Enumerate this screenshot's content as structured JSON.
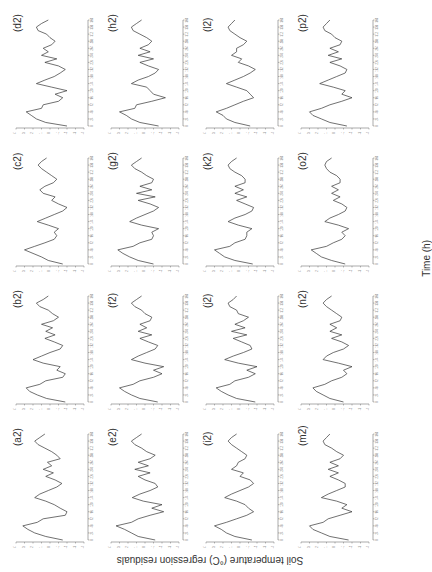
{
  "figure": {
    "y_axis_title": "Soil temperature (°C) regression residuals",
    "x_axis_title": "Time (h)",
    "orientation_note": "rotated 90° counter-clockwise",
    "line_color": "#333333",
    "axis_color": "#555555"
  },
  "chart_data": {
    "type": "line",
    "title": "",
    "xlabel": "Time (h)",
    "ylabel": "Soil temperature (°C) regression residuals",
    "x_ticks": [
      0,
      24,
      48,
      72,
      96,
      120,
      144,
      168,
      192,
      216,
      240,
      264,
      288,
      312,
      336,
      360
    ],
    "y_ticks": [
      -4,
      -3,
      -2,
      -1,
      0,
      1,
      2,
      3,
      4
    ],
    "xlim": [
      0,
      360
    ],
    "ylim": [
      -4,
      4
    ],
    "grid": false,
    "legend": "none",
    "x": [
      0,
      12,
      24,
      36,
      48,
      60,
      72,
      84,
      96,
      108,
      120,
      132,
      144,
      156,
      168,
      180,
      192,
      204,
      216,
      228,
      240,
      252,
      264,
      276,
      288,
      300,
      312,
      324,
      336,
      348,
      360
    ],
    "layout": {
      "rows": [
        [
          "d2",
          "h2",
          "l2",
          "p2"
        ],
        [
          "c2",
          "g2",
          "k2",
          "o2"
        ],
        [
          "b2",
          "f2",
          "j2",
          "n2"
        ],
        [
          "a2",
          "e2",
          "i2",
          "m2"
        ]
      ]
    },
    "panels": [
      {
        "id": "a2",
        "label": "(a2)",
        "values": [
          -1.5,
          0.5,
          1.8,
          2.6,
          3.2,
          1.5,
          0.8,
          -1.8,
          -2.0,
          -1.2,
          -0.5,
          0.5,
          1.8,
          1.2,
          0.2,
          -0.8,
          -1.4,
          -0.6,
          0.5,
          -0.4,
          0.8,
          -0.2,
          0.3,
          -1.2,
          -0.8,
          -0.2,
          0.6,
          1.4,
          1.8,
          1.2,
          0.6
        ]
      },
      {
        "id": "b2",
        "label": "(b2)",
        "values": [
          -1.8,
          0.4,
          1.5,
          2.4,
          2.8,
          1.2,
          0.5,
          -1.5,
          -1.8,
          -0.8,
          -1.2,
          0.8,
          2.0,
          1.0,
          0.0,
          -1.2,
          -1.5,
          -0.5,
          0.6,
          -0.6,
          0.5,
          -0.3,
          1.0,
          -0.4,
          -1.0,
          -0.3,
          0.2,
          1.2,
          1.6,
          0.8,
          0.2
        ]
      },
      {
        "id": "c2",
        "label": "(c2)",
        "values": [
          -1.5,
          0.2,
          1.0,
          2.0,
          3.0,
          1.8,
          0.6,
          -0.5,
          -0.8,
          -0.5,
          -1.0,
          0.2,
          1.5,
          0.5,
          -0.5,
          -1.5,
          -2.0,
          -1.0,
          -0.2,
          -0.6,
          0.8,
          1.2,
          0.6,
          -0.4,
          -0.8,
          -0.2,
          0.4,
          1.0,
          1.4,
          1.0,
          0.4
        ]
      },
      {
        "id": "d2",
        "label": "(d2)",
        "values": [
          -2.0,
          0.5,
          1.6,
          2.2,
          2.8,
          1.0,
          0.8,
          -1.0,
          -1.5,
          -0.6,
          -2.0,
          -0.2,
          1.6,
          0.6,
          -0.5,
          -1.2,
          -1.8,
          -1.0,
          0.6,
          -0.8,
          1.0,
          0.2,
          0.8,
          -0.2,
          -0.6,
          0.0,
          0.4,
          1.4,
          1.6,
          1.0,
          0.2
        ]
      },
      {
        "id": "e2",
        "label": "(e2)",
        "values": [
          -1.2,
          0.8,
          1.6,
          2.4,
          3.4,
          1.6,
          0.8,
          -0.6,
          -2.2,
          -0.8,
          -2.0,
          0.2,
          1.5,
          0.6,
          -0.6,
          -1.5,
          -1.2,
          0.0,
          0.8,
          -0.6,
          1.2,
          -0.4,
          0.8,
          -0.6,
          -1.2,
          -0.2,
          0.4,
          1.2,
          1.6,
          1.0,
          0.4
        ]
      },
      {
        "id": "f2",
        "label": "(f2)",
        "values": [
          -1.5,
          0.6,
          1.6,
          2.4,
          3.0,
          1.4,
          0.6,
          -1.0,
          -2.0,
          -1.0,
          -2.2,
          0.0,
          1.6,
          0.8,
          -0.2,
          -1.2,
          -1.5,
          -0.4,
          0.6,
          -0.8,
          0.8,
          -0.2,
          0.6,
          -0.6,
          -0.8,
          0.0,
          0.4,
          1.2,
          1.6,
          1.0,
          0.4
        ]
      },
      {
        "id": "g2",
        "label": "(g2)",
        "values": [
          -1.0,
          0.8,
          1.8,
          2.6,
          3.2,
          1.4,
          0.6,
          -0.8,
          -1.0,
          -0.8,
          -1.6,
          0.4,
          1.8,
          1.0,
          0.0,
          -1.0,
          -1.6,
          -0.6,
          0.8,
          -1.2,
          1.0,
          -0.8,
          0.6,
          -0.8,
          -1.0,
          -0.2,
          0.4,
          1.2,
          1.6,
          1.0,
          0.4
        ]
      },
      {
        "id": "h2",
        "label": "(h2)",
        "values": [
          -1.6,
          0.6,
          1.6,
          2.2,
          3.0,
          1.2,
          1.0,
          -0.8,
          -2.4,
          -1.0,
          -0.6,
          -0.2,
          1.6,
          0.8,
          -0.4,
          -1.2,
          -1.6,
          -0.4,
          0.6,
          -1.0,
          0.8,
          -0.6,
          0.6,
          -0.4,
          -0.8,
          -0.2,
          0.6,
          1.4,
          1.6,
          1.0,
          0.4
        ]
      },
      {
        "id": "i2",
        "label": "(i2)",
        "values": [
          -1.4,
          0.6,
          1.6,
          2.2,
          3.0,
          1.6,
          0.4,
          -0.8,
          -1.6,
          -1.0,
          -0.6,
          0.4,
          1.8,
          1.0,
          0.0,
          -1.0,
          -1.6,
          -1.2,
          0.0,
          -0.4,
          1.0,
          0.4,
          0.2,
          -0.6,
          -0.8,
          -0.2,
          0.4,
          1.0,
          1.4,
          1.0,
          0.4
        ]
      },
      {
        "id": "j2",
        "label": "(j2)",
        "values": [
          -1.8,
          0.4,
          1.4,
          2.2,
          2.8,
          1.2,
          0.6,
          -1.0,
          -1.8,
          -0.8,
          -2.0,
          0.2,
          1.8,
          0.8,
          -0.4,
          -1.4,
          -1.2,
          -0.2,
          0.8,
          -0.8,
          1.0,
          -0.6,
          0.6,
          -0.4,
          -1.0,
          0.2,
          0.4,
          1.2,
          1.4,
          0.8,
          0.4
        ]
      },
      {
        "id": "k2",
        "label": "(k2)",
        "values": [
          -1.5,
          0.6,
          1.8,
          2.4,
          3.0,
          1.2,
          0.6,
          -0.6,
          -0.8,
          -0.8,
          -1.4,
          0.2,
          1.4,
          0.6,
          -0.6,
          -1.4,
          -1.6,
          -0.6,
          0.4,
          -0.8,
          0.6,
          -0.4,
          0.6,
          -0.6,
          -0.6,
          -0.2,
          0.6,
          1.2,
          1.4,
          1.0,
          0.4
        ]
      },
      {
        "id": "l2",
        "label": "(l2)",
        "values": [
          -1.2,
          0.6,
          1.6,
          2.0,
          2.8,
          1.6,
          0.6,
          -0.4,
          -1.6,
          -1.2,
          -0.8,
          0.4,
          1.6,
          0.6,
          -0.4,
          -1.2,
          -1.8,
          -1.0,
          0.2,
          -0.2,
          1.0,
          0.4,
          0.4,
          -0.4,
          -0.8,
          0.0,
          0.6,
          1.2,
          1.4,
          1.0,
          0.6
        ]
      },
      {
        "id": "m2",
        "label": "(m2)",
        "values": [
          -1.6,
          0.6,
          1.6,
          2.6,
          3.0,
          1.4,
          0.8,
          -0.6,
          -2.0,
          -0.8,
          -1.4,
          -0.2,
          1.6,
          0.8,
          -0.2,
          -1.2,
          -1.2,
          -0.4,
          0.6,
          -0.4,
          0.8,
          -0.4,
          0.6,
          -0.6,
          -1.0,
          -0.2,
          0.4,
          1.2,
          1.4,
          1.0,
          0.6
        ]
      },
      {
        "id": "n2",
        "label": "(n2)",
        "values": [
          -1.0,
          0.6,
          1.4,
          2.2,
          2.6,
          1.2,
          0.4,
          -0.8,
          -1.4,
          -1.0,
          -2.0,
          -0.4,
          1.4,
          1.0,
          0.2,
          -1.0,
          -1.6,
          -0.8,
          0.4,
          -0.8,
          0.6,
          -0.2,
          0.6,
          -0.6,
          -0.8,
          -0.2,
          0.4,
          1.0,
          1.4,
          1.0,
          0.4
        ]
      },
      {
        "id": "o2",
        "label": "(o2)",
        "values": [
          -1.2,
          0.4,
          1.6,
          2.2,
          2.8,
          1.0,
          0.2,
          -0.8,
          -1.2,
          -0.8,
          -1.6,
          -0.4,
          1.2,
          0.6,
          -0.4,
          -1.2,
          -1.4,
          -0.8,
          0.2,
          -0.6,
          0.4,
          -0.4,
          0.4,
          -0.6,
          -0.6,
          -0.2,
          0.6,
          1.0,
          1.2,
          1.0,
          0.4
        ]
      },
      {
        "id": "p2",
        "label": "(p2)",
        "values": [
          -1.4,
          0.6,
          1.6,
          2.6,
          3.0,
          1.6,
          0.6,
          -0.8,
          -2.0,
          -0.8,
          -1.2,
          0.2,
          1.8,
          0.8,
          -0.2,
          -1.2,
          -1.4,
          -0.6,
          0.6,
          -0.8,
          0.8,
          -0.4,
          0.6,
          -0.6,
          -0.8,
          0.0,
          0.4,
          1.2,
          1.4,
          1.0,
          0.6
        ]
      }
    ]
  }
}
